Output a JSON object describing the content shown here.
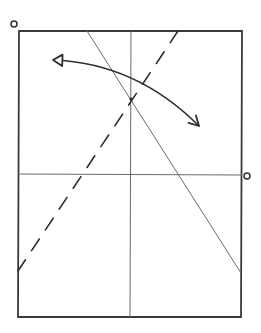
{
  "diagram": {
    "type": "origami-fold-diagram",
    "colors": {
      "background": "#ffffff",
      "outline": "#3a3a3a",
      "crease": "#6a6a6a",
      "arrow": "#2e2e2e"
    },
    "paper": {
      "shape": "rectangle",
      "corners": {
        "top_left": [
          19,
          31
        ],
        "top_right": [
          242,
          31
        ],
        "bottom_right": [
          241,
          317
        ],
        "bottom_left": [
          18,
          317
        ]
      }
    },
    "creases": [
      {
        "name": "vertical-center-crease",
        "style": "solid",
        "from": [
          131,
          31
        ],
        "to": [
          130,
          317
        ]
      },
      {
        "name": "horizontal-center-crease",
        "style": "solid",
        "from": [
          18,
          174
        ],
        "to": [
          242,
          175
        ]
      },
      {
        "name": "diagonal-crease",
        "style": "solid",
        "from": [
          87,
          31
        ],
        "to": [
          241,
          273
        ]
      }
    ],
    "fold_lines": [
      {
        "name": "valley-fold-line",
        "style": "dashed",
        "from": [
          178,
          31
        ],
        "to": [
          18,
          271
        ]
      }
    ],
    "arrows": [
      {
        "name": "fold-arrow",
        "style": "double-headed-curved",
        "from": [
          53,
          60
        ],
        "via": [
          131,
          78
        ],
        "to": [
          199,
          126
        ]
      }
    ],
    "markers": [
      {
        "name": "reference-point-top-left",
        "shape": "circle",
        "center": [
          14,
          24
        ],
        "radius": 3
      },
      {
        "name": "reference-point-right",
        "shape": "circle",
        "center": [
          247,
          176
        ],
        "radius": 3
      },
      {
        "name": "intersection-dot",
        "shape": "dot",
        "center": [
          131,
          99
        ],
        "radius": 1.6
      }
    ]
  }
}
